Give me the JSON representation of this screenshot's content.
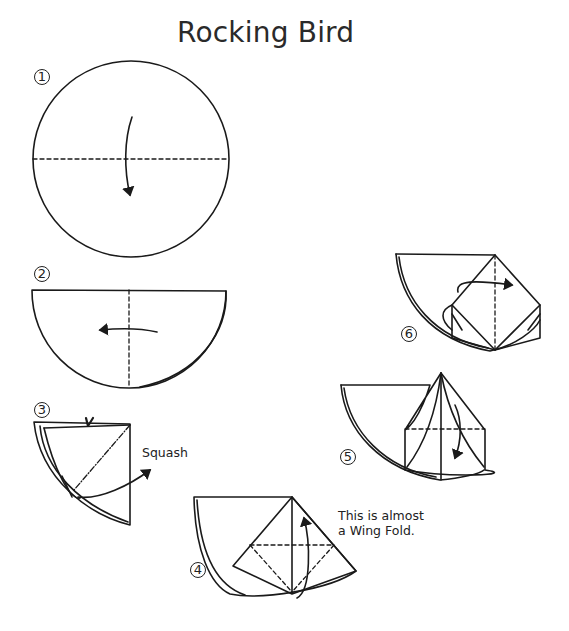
{
  "title": "Rocking Bird",
  "steps": [
    {
      "number": "1",
      "label": "①"
    },
    {
      "number": "2",
      "label": "②"
    },
    {
      "number": "3",
      "label": "③"
    },
    {
      "number": "4",
      "label": "④"
    },
    {
      "number": "5",
      "label": "⑤"
    },
    {
      "number": "6",
      "label": "⑥"
    }
  ],
  "annotations": {
    "squash": "Squash",
    "wing_fold_line1": "This is almost",
    "wing_fold_line2": "a Wing Fold."
  }
}
